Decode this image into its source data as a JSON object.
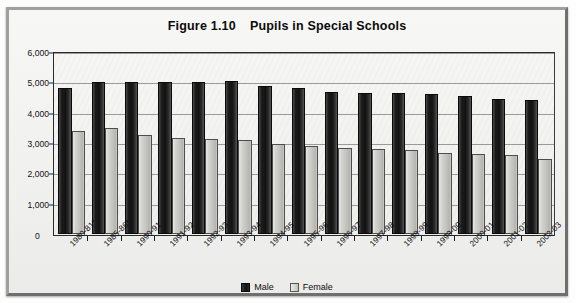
{
  "figure": {
    "title_number": "Figure 1.10",
    "title_text": "Pupils in Special Schools"
  },
  "legend": {
    "items": [
      {
        "label": "Male",
        "color": "#141414",
        "swatch": "male"
      },
      {
        "label": "Female",
        "color": "#cacac6",
        "swatch": "female"
      }
    ]
  },
  "axis": {
    "y_ticks": [
      "6,000",
      "5,000",
      "4,000",
      "3,000",
      "2,000",
      "1,000",
      "0"
    ],
    "y_zero_label": "0"
  },
  "chart_data": {
    "type": "bar",
    "xlabel": "",
    "ylabel": "",
    "ylim": [
      0,
      6000
    ],
    "ytick_values": [
      0,
      1000,
      2000,
      3000,
      4000,
      5000,
      6000
    ],
    "ytick_labels": [
      "0",
      "1,000",
      "2,000",
      "3,000",
      "4,000",
      "5,000",
      "6,000"
    ],
    "grid": true,
    "legend_position": "bottom-center",
    "categories": [
      "1980-81*",
      "1985-86*",
      "1990-91",
      "1991-92",
      "1992-93",
      "1993-94",
      "1994-95",
      "1995-96",
      "1996-97",
      "1997-98",
      "1998-99",
      "1999-00",
      "2000-01",
      "2001-02",
      "2002-03"
    ],
    "series": [
      {
        "name": "Male",
        "color": "#141414",
        "values": [
          4800,
          5000,
          5000,
          5000,
          5000,
          5050,
          4880,
          4800,
          4680,
          4650,
          4660,
          4600,
          4560,
          4460,
          4420
        ]
      },
      {
        "name": "Female",
        "color": "#cacac6",
        "values": [
          3380,
          3480,
          3250,
          3160,
          3120,
          3110,
          2980,
          2900,
          2850,
          2800,
          2760,
          2680,
          2650,
          2590,
          2470
        ]
      }
    ]
  }
}
